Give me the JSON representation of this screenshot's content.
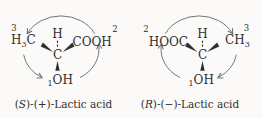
{
  "figure": {
    "background": "#fbfaf8",
    "ink": "#2f2f2f",
    "light_ink": "#8f8f8f",
    "arrow_color": "#666666"
  },
  "molecules": [
    {
      "name": "s-lactic-acid",
      "rotation": "counterclockwise",
      "top_atom": "H",
      "center_atom": "C",
      "left_group": {
        "sup_priority": "3",
        "t1": "H",
        "sub": "3",
        "t2": "C"
      },
      "right_group": {
        "label": "COOH",
        "sup_priority": "2"
      },
      "bottom_group": {
        "sub_priority": "1",
        "label": "OH"
      },
      "caption": {
        "open": "(",
        "stereo": "S",
        "rest": ")-(+)-Lactic acid"
      }
    },
    {
      "name": "r-lactic-acid",
      "rotation": "clockwise",
      "top_atom": "H",
      "center_atom": "C",
      "left_group": {
        "sup_priority": "2",
        "label": "HOOC"
      },
      "right_group": {
        "t1": "CH",
        "sub": "3",
        "sup_priority": "3"
      },
      "bottom_group": {
        "sub_priority": "1",
        "label": "OH"
      },
      "caption": {
        "open": "(",
        "stereo": "R",
        "rest": ")-(−)-Lactic acid"
      }
    }
  ]
}
